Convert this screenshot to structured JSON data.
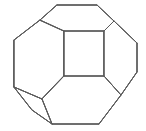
{
  "figure": {
    "name": "polyhedron-wireframe",
    "shape_label": "truncated octahedron",
    "background_color": "#ffffff",
    "stroke_color": "#5a5a5a",
    "stroke_width": 1,
    "canvas": {
      "width": 146,
      "height": 131
    },
    "vertices": {
      "top_left_of_top_edge": [
        57,
        5
      ],
      "top_right_of_top_edge": [
        97,
        5
      ],
      "upper_left_shoulder": [
        40,
        20
      ],
      "upper_right_shoulder": [
        114,
        21
      ],
      "left_upper": [
        14,
        40
      ],
      "right_upper": [
        137,
        43
      ],
      "left_lower": [
        14,
        87
      ],
      "right_lower": [
        137,
        72
      ],
      "lower_left_spur": [
        32,
        110
      ],
      "lower_left_inner": [
        42,
        99
      ],
      "bottom_left_of_bottom_edge": [
        52,
        124
      ],
      "bottom_right_of_bottom_edge": [
        99,
        124
      ],
      "lower_right_junction": [
        121,
        95
      ],
      "square_top_left": [
        64,
        31
      ],
      "square_top_right": [
        104,
        31
      ],
      "square_bottom_left": [
        64,
        76
      ],
      "square_bottom_right": [
        104,
        76
      ]
    },
    "faces": [
      {
        "id": "center-square-face",
        "label": "central square facet",
        "points": "64,31 104,31 104,76 64,76"
      },
      {
        "id": "outer-silhouette",
        "label": "outer polygon silhouette",
        "points": "57,5 97,5 114,21 137,43 137,72 121,95 99,124 52,124 32,110 14,87 14,40 40,20"
      },
      {
        "id": "top-hexagon-face",
        "label": "upper hexagonal facet",
        "points": "40,20 57,5 97,5 114,21 104,31 64,31"
      },
      {
        "id": "left-hexagon-face",
        "label": "left hexagonal facet",
        "points": "14,40 40,20 64,31 64,76 42,99 14,87"
      },
      {
        "id": "right-hexagon-face",
        "label": "right hexagonal facet",
        "points": "104,31 114,21 137,43 137,72 121,95 104,76"
      },
      {
        "id": "bottom-hexagon-face",
        "label": "lower hexagonal facet",
        "points": "64,76 104,76 121,95 99,124 52,124 42,99"
      },
      {
        "id": "lower-left-quad-face",
        "label": "lower left quadrilateral facet",
        "points": "14,87 42,99 52,124 32,110"
      }
    ],
    "edges": [
      {
        "id": "edge-top",
        "from": "top_left_of_top_edge",
        "to": "top_right_of_top_edge"
      },
      {
        "id": "edge-top-right-shoulder",
        "from": "top_right_of_top_edge",
        "to": "upper_right_shoulder"
      },
      {
        "id": "edge-right-upper-slant",
        "from": "upper_right_shoulder",
        "to": "right_upper"
      },
      {
        "id": "edge-right-vertical",
        "from": "right_upper",
        "to": "right_lower"
      },
      {
        "id": "edge-right-lower-slant",
        "from": "right_lower",
        "to": "lower_right_junction"
      },
      {
        "id": "edge-bottom-right-slant",
        "from": "lower_right_junction",
        "to": "bottom_right_of_bottom_edge"
      },
      {
        "id": "edge-bottom",
        "from": "bottom_right_of_bottom_edge",
        "to": "bottom_left_of_bottom_edge"
      },
      {
        "id": "edge-bottom-left-slant",
        "from": "bottom_left_of_bottom_edge",
        "to": "lower_left_spur"
      },
      {
        "id": "edge-lower-left-spur",
        "from": "lower_left_spur",
        "to": "left_lower"
      },
      {
        "id": "edge-left-vertical",
        "from": "left_lower",
        "to": "left_upper"
      },
      {
        "id": "edge-left-upper-slant",
        "from": "left_upper",
        "to": "upper_left_shoulder"
      },
      {
        "id": "edge-top-left-shoulder",
        "from": "upper_left_shoulder",
        "to": "top_left_of_top_edge"
      },
      {
        "id": "edge-square-top",
        "from": "square_top_left",
        "to": "square_top_right"
      },
      {
        "id": "edge-square-right",
        "from": "square_top_right",
        "to": "square_bottom_right"
      },
      {
        "id": "edge-square-bottom",
        "from": "square_bottom_right",
        "to": "square_bottom_left"
      },
      {
        "id": "edge-square-left",
        "from": "square_bottom_left",
        "to": "square_top_left"
      },
      {
        "id": "edge-shoulder-to-square-tl",
        "from": "upper_left_shoulder",
        "to": "square_top_left"
      },
      {
        "id": "edge-shoulder-to-square-tr",
        "from": "upper_right_shoulder",
        "to": "square_top_right"
      },
      {
        "id": "edge-square-bl-to-inner",
        "from": "square_bottom_left",
        "to": "lower_left_inner"
      },
      {
        "id": "edge-square-br-to-junction",
        "from": "square_bottom_right",
        "to": "lower_right_junction"
      },
      {
        "id": "edge-inner-to-left-lower",
        "from": "lower_left_inner",
        "to": "left_lower"
      },
      {
        "id": "edge-inner-to-bottom-left",
        "from": "lower_left_inner",
        "to": "bottom_left_of_bottom_edge"
      }
    ]
  }
}
